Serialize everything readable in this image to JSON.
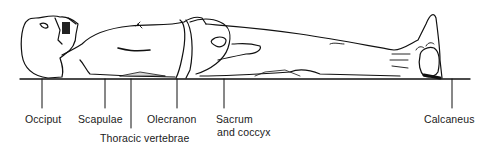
{
  "figure": {
    "labels": [
      {
        "id": "occiput",
        "text": "Occiput",
        "x": 25,
        "y": 113
      },
      {
        "id": "scapulae",
        "text": "Scapulae",
        "x": 78,
        "y": 113
      },
      {
        "id": "thoracic-vertebrae",
        "text": "Thoracic vertebrae",
        "x": 100,
        "y": 132
      },
      {
        "id": "olecranon",
        "text": "Olecranon",
        "x": 147,
        "y": 113
      },
      {
        "id": "sacrum-and-coccyx",
        "text": "Sacrum",
        "text2": "and coccyx",
        "x": 216,
        "y": 113
      },
      {
        "id": "calcaneus",
        "text": "Calcaneus",
        "x": 424,
        "y": 113
      }
    ]
  }
}
